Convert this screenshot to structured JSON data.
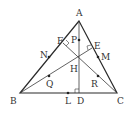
{
  "figure": {
    "type": "triangle-orthocenter-nine-point",
    "vertices": {
      "A": {
        "label": "A",
        "x": 79,
        "y": 21
      },
      "B": {
        "label": "B",
        "x": 20,
        "y": 93
      },
      "C": {
        "label": "C",
        "x": 117,
        "y": 93
      }
    },
    "feet_of_altitudes": {
      "D": {
        "label": "D",
        "x": 79,
        "y": 93
      },
      "E": {
        "label": "E",
        "x": 92,
        "y": 48
      },
      "F": {
        "label": "F",
        "x": 63,
        "y": 43
      }
    },
    "orthocenter": {
      "label": "H",
      "x": 79,
      "y": 59
    },
    "midpoints_of_sides": {
      "L": {
        "label": "L",
        "x": 68,
        "y": 93
      },
      "M": {
        "label": "M",
        "x": 98,
        "y": 57
      },
      "N": {
        "label": "N",
        "x": 49,
        "y": 57
      }
    },
    "midpoints_to_orthocenter": {
      "P": {
        "label": "P",
        "x": 79,
        "y": 40
      },
      "Q": {
        "label": "Q",
        "x": 49,
        "y": 76
      },
      "R": {
        "label": "R",
        "x": 98,
        "y": 76
      }
    },
    "colors": {
      "line": "#2a2a2a",
      "text": "#333333",
      "background": "#ffffff"
    }
  }
}
